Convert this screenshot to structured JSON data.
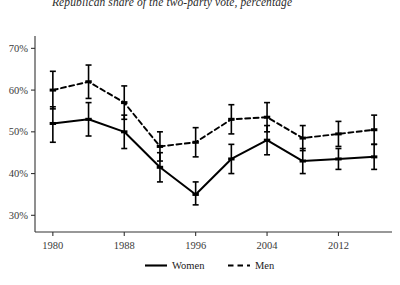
{
  "chart_data": {
    "type": "line",
    "title": "Republican share of the two-party vote, percentage",
    "xlabel": "",
    "ylabel": "",
    "x": [
      1980,
      1984,
      1988,
      1992,
      1996,
      2000,
      2004,
      2008,
      2012,
      2016
    ],
    "xticks": [
      1980,
      1988,
      1996,
      2004,
      2012
    ],
    "xtick_labels": [
      "1980",
      "1988",
      "1996",
      "2004",
      "2012"
    ],
    "xlim": [
      1978,
      2018
    ],
    "yticks": [
      30,
      40,
      50,
      60,
      70
    ],
    "ytick_labels": [
      "30%",
      "40%",
      "50%",
      "60%",
      "70%"
    ],
    "ylim": [
      26,
      72
    ],
    "grid": false,
    "legend_position": "bottom",
    "series": [
      {
        "name": "Women",
        "style": "solid",
        "color": "#000000",
        "values": [
          52,
          53,
          50,
          41.5,
          35,
          43.5,
          48,
          43,
          43.5,
          44
        ],
        "error_low": [
          47.5,
          49,
          46,
          38,
          32.5,
          40,
          44.5,
          40,
          41,
          41
        ],
        "error_high": [
          56,
          57,
          54,
          45,
          38,
          47,
          51.5,
          46,
          46,
          47
        ]
      },
      {
        "name": "Men",
        "style": "dashed",
        "color": "#000000",
        "values": [
          60,
          62,
          57,
          46.5,
          47.5,
          53,
          53.5,
          48.5,
          49.5,
          50.5
        ],
        "error_low": [
          55.5,
          58,
          53,
          43,
          44,
          49.5,
          50,
          45.5,
          46.5,
          47
        ],
        "error_high": [
          64.5,
          66,
          61,
          50,
          51,
          56.5,
          57,
          51.5,
          52.5,
          54
        ]
      }
    ]
  },
  "legend": {
    "items": [
      {
        "label": "Women",
        "style": "solid"
      },
      {
        "label": "Men",
        "style": "dashed"
      }
    ]
  }
}
